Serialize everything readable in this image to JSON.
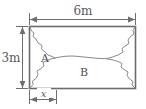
{
  "figure": {
    "background_color": "#ffffff",
    "outline_color": "#6b6b6e",
    "jagged_color": "#8a8a8d",
    "dimension_color": "#6e6e71",
    "text_color": "#59595c",
    "shape": "rectangle",
    "labels": {
      "top_dimension": "6m",
      "left_dimension": "3m",
      "bottom_dimension": "x",
      "region_a": "A",
      "region_b": "B"
    },
    "dimensions": {
      "width_value": 6,
      "height_value": 3,
      "width_unit": "m",
      "height_unit": "m",
      "segment_label": "x"
    },
    "regions": [
      {
        "id": "A",
        "label": "A",
        "position": "left"
      },
      {
        "id": "B",
        "label": "B",
        "position": "bottom-center"
      }
    ]
  }
}
